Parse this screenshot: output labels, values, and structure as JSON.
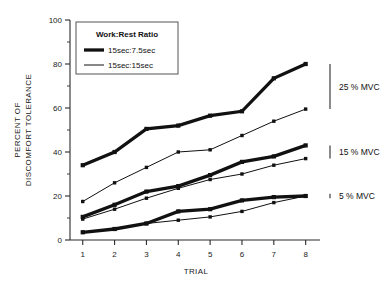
{
  "chart_data": {
    "type": "line",
    "title": "",
    "xlabel": "TRIAL",
    "ylabel": "PERCENT OF DISCOMFORT TOLERANCE",
    "ylabel_line1": "PERCENT OF",
    "ylabel_line2": "DISCOMFORT TOLERANCE",
    "x": [
      1,
      2,
      3,
      4,
      5,
      6,
      7,
      8
    ],
    "xtick_labels": [
      "1",
      "2",
      "3",
      "4",
      "5",
      "6",
      "7",
      "8"
    ],
    "ytick_labels": [
      "0",
      "20",
      "40",
      "60",
      "80",
      "100"
    ],
    "ytick_values": [
      0,
      20,
      40,
      60,
      80,
      100
    ],
    "yminor_values": [
      10,
      30,
      50,
      70,
      90
    ],
    "xlim": [
      0.6,
      8.45
    ],
    "ylim": [
      0,
      100
    ],
    "grid": false,
    "legend": {
      "position": "top-left-inside",
      "title": "Work:Rest Ratio",
      "entries": [
        {
          "label": "15sec:7.5sec",
          "style": "thick"
        },
        {
          "label": "15sec:15sec",
          "style": "thin"
        }
      ]
    },
    "series": [
      {
        "name": "25 % MVC  15sec:7.5sec",
        "group": "25 % MVC",
        "style": "thick",
        "values": [
          34,
          40,
          50.5,
          52,
          56.5,
          58.5,
          73.5,
          80
        ]
      },
      {
        "name": "25 % MVC  15sec:15sec",
        "group": "25 % MVC",
        "style": "thin",
        "values": [
          17.5,
          26,
          33,
          40,
          41,
          47.5,
          54,
          59.5
        ]
      },
      {
        "name": "15 % MVC  15sec:7.5sec",
        "group": "15 % MVC",
        "style": "thick",
        "values": [
          10.5,
          16,
          22,
          24.5,
          29.5,
          35.5,
          38,
          43
        ]
      },
      {
        "name": "15 % MVC  15sec:15sec",
        "group": "15 % MVC",
        "style": "thin",
        "values": [
          9.5,
          14,
          19,
          23.5,
          27.5,
          30,
          34,
          37
        ]
      },
      {
        "name": "5 % MVC  15sec:7.5sec",
        "group": "5 % MVC",
        "style": "thick",
        "values": [
          3.5,
          5,
          7.5,
          13,
          14,
          18,
          19.5,
          20
        ]
      },
      {
        "name": "5 % MVC  15sec:15sec",
        "group": "5 % MVC",
        "style": "thin",
        "values": [
          3.5,
          5,
          7.5,
          9,
          10.5,
          13,
          17,
          20
        ]
      }
    ],
    "annotations": [
      {
        "label": "25 % MVC",
        "bracket_top": 80,
        "bracket_bottom": 59.5
      },
      {
        "label": "15 % MVC",
        "bracket_top": 43,
        "bracket_bottom": 37
      },
      {
        "label": "5 % MVC",
        "bracket_top": 21,
        "bracket_bottom": 19
      }
    ]
  },
  "caption": {
    "text": ""
  }
}
